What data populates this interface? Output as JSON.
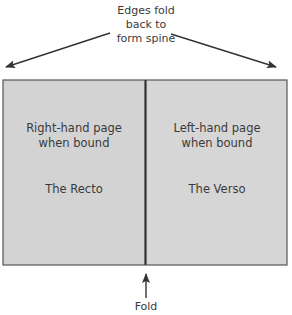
{
  "diagram": {
    "top_label_lines": [
      "Edges fold",
      "back to",
      "form spine"
    ],
    "recto": {
      "description_lines": [
        "Right-hand page",
        "when bound"
      ],
      "name": "The Recto"
    },
    "verso": {
      "description_lines": [
        "Left-hand page",
        "when bound"
      ],
      "name": "The Verso"
    },
    "fold_label": "Fold",
    "colors": {
      "page_fill": "#d3d3d3",
      "outline": "#555555",
      "arrow": "#333333",
      "text": "#3a3a3a"
    }
  }
}
